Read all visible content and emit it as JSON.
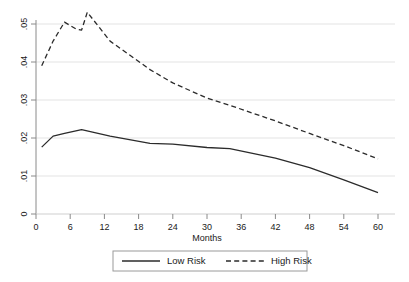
{
  "chart_data": {
    "type": "line",
    "title": "",
    "subtitle": "",
    "xlabel": "Months",
    "ylabel": "",
    "xlim": [
      0,
      60
    ],
    "ylim": [
      0,
      0.055
    ],
    "grid": "horizontal",
    "legend_position": "bottom-center",
    "xticks": [
      "0",
      "6",
      "12",
      "18",
      "24",
      "30",
      "36",
      "42",
      "48",
      "54",
      "60"
    ],
    "xtick_values": [
      0,
      6,
      12,
      18,
      24,
      30,
      36,
      42,
      48,
      54,
      60
    ],
    "yticks": [
      "0",
      ".01",
      ".02",
      ".03",
      ".04",
      ".05"
    ],
    "ytick_values": [
      0,
      0.01,
      0.02,
      0.03,
      0.04,
      0.05
    ],
    "series": [
      {
        "name": "Low Risk",
        "style": "solid",
        "color": "#2b2b2b",
        "x": [
          1,
          3,
          5,
          8,
          13,
          20,
          24,
          30,
          34,
          42,
          48,
          54,
          60
        ],
        "values": [
          0.0176,
          0.0205,
          0.0212,
          0.0222,
          0.0205,
          0.0186,
          0.0184,
          0.0175,
          0.0172,
          0.0147,
          0.0122,
          0.009,
          0.0056
        ]
      },
      {
        "name": "High Risk",
        "style": "dashed",
        "color": "#2b2b2b",
        "x": [
          1,
          3,
          5,
          7,
          8,
          9,
          13,
          20,
          24,
          30,
          34,
          42,
          48,
          54,
          60
        ],
        "values": [
          0.039,
          0.0455,
          0.0505,
          0.0487,
          0.0484,
          0.0531,
          0.0455,
          0.038,
          0.0345,
          0.0305,
          0.0286,
          0.0245,
          0.0212,
          0.018,
          0.0145
        ]
      }
    ]
  },
  "legend": {
    "entries": [
      {
        "label": "Low Risk",
        "style": "solid"
      },
      {
        "label": "High Risk",
        "style": "dashed"
      }
    ]
  },
  "colors": {
    "line": "#2b2b2b",
    "grid": "#e3e3e3",
    "axis": "#8a8a8a",
    "text": "#1a1a1a",
    "legend_border": "#9a9a9a",
    "background": "#ffffff"
  }
}
